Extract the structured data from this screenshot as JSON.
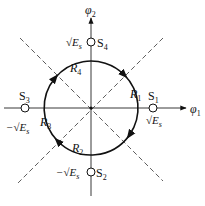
{
  "diagram": {
    "axes": {
      "x_label": "φ",
      "x_sub": "1",
      "y_label": "φ",
      "y_sub": "2"
    },
    "signal_points": [
      {
        "id": "S1",
        "name": "S",
        "sub": "1",
        "value_label": "√E",
        "value_sub": "s",
        "sign": ""
      },
      {
        "id": "S2",
        "name": "S",
        "sub": "2",
        "value_label": "√E",
        "value_sub": "s",
        "sign": "−"
      },
      {
        "id": "S3",
        "name": "S",
        "sub": "3",
        "value_label": "√E",
        "value_sub": "s",
        "sign": "−"
      },
      {
        "id": "S4",
        "name": "S",
        "sub": "4",
        "value_label": "√E",
        "value_sub": "s",
        "sign": ""
      }
    ],
    "regions": [
      {
        "id": "R1",
        "name": "R",
        "sub": "1"
      },
      {
        "id": "R2",
        "name": "R",
        "sub": "2"
      },
      {
        "id": "R3",
        "name": "R",
        "sub": "3"
      },
      {
        "id": "R4",
        "name": "R",
        "sub": "4"
      }
    ]
  }
}
